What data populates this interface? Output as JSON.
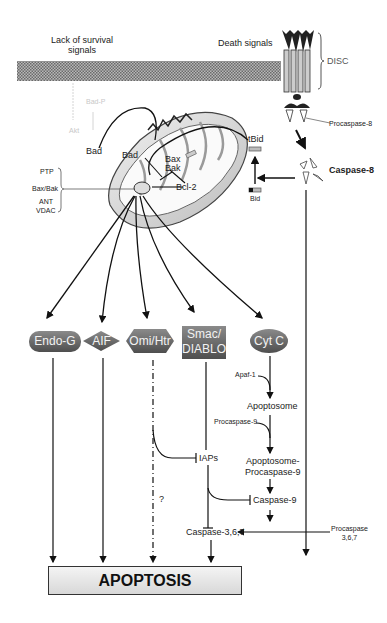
{
  "diagram": {
    "title_left": "Lack of survival signals",
    "title_left_line1": "Lack of survival",
    "title_left_line2": "signals",
    "title_right": "Death signals",
    "disc_label": "DISC",
    "procaspase8_label": "Procaspase-8",
    "caspase8_label": "Caspase-8",
    "tbid_label": "tBid",
    "bid_label": "Bid",
    "bad_outer_label": "Bad",
    "bad_inner_label": "Bad",
    "bax_label": "Bax",
    "bak_label": "Bak",
    "bcl_label": "Bcl-2",
    "faded_bad_p_label": "Bad-P",
    "faded_akt_label": "Akt",
    "pore_labels": [
      "PTP",
      "Bax/Bak",
      "ANT",
      "VDAC"
    ],
    "factors": [
      {
        "label": "Endo-G",
        "shape": "rounded-rect"
      },
      {
        "label": "AIF",
        "shape": "diamond"
      },
      {
        "label": "Omi/Htr",
        "shape": "hexagon"
      },
      {
        "label_line1": "Smac/",
        "label_line2": "DIABLO",
        "shape": "rect"
      },
      {
        "label": "Cyt C",
        "shape": "ellipse"
      }
    ],
    "apaf1_label": "Apaf-1",
    "apoptosome_label": "Apoptosome",
    "procaspase9_label": "Procaspase-9",
    "apoptosome_procaspase9_line1": "Apoptosome-",
    "apoptosome_procaspase9_line2": "Procaspase-9",
    "iaps_label": "IAPs",
    "caspase9_label": "Caspase-9",
    "question_mark": "?",
    "caspase367_label": "Caspase-3,6,7",
    "procaspase367_line1": "Procaspase",
    "procaspase367_line2": "3,6,7",
    "apoptosis_label": "APOPTOSIS"
  },
  "colors": {
    "shape_fill": "#6e6e6e",
    "shape_text": "#f2f2f2",
    "line": "#111111",
    "membrane": "#9a9a9a"
  }
}
